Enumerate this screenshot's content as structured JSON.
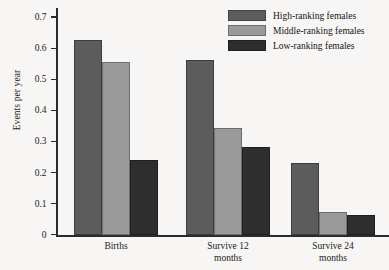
{
  "chart_data": {
    "type": "bar",
    "title": "",
    "xlabel": "",
    "ylabel": "Events per year",
    "categories": [
      "Births",
      "Survive 12 months",
      "Survive 24 months"
    ],
    "category_lines": [
      [
        "Births"
      ],
      [
        "Survive 12",
        "months"
      ],
      [
        "Survive 24",
        "months"
      ]
    ],
    "series": [
      {
        "name": "High-ranking females",
        "color": "#5c5c5c",
        "values": [
          0.63,
          0.563,
          0.234
        ]
      },
      {
        "name": "Middle-ranking females",
        "color": "#9a9a9a",
        "values": [
          0.559,
          0.344,
          0.075
        ]
      },
      {
        "name": "Low-ranking females",
        "color": "#2e2e2e",
        "values": [
          0.241,
          0.283,
          0.065
        ]
      }
    ],
    "ylim": [
      0,
      0.73
    ],
    "yticks": [
      0,
      0.1,
      0.2,
      0.3,
      0.4,
      0.5,
      0.6,
      0.7
    ],
    "ytick_labels": [
      "0",
      "0.1",
      "0.2",
      "0.3",
      "0.4",
      "0.5",
      "0.6",
      "0.7"
    ],
    "grid": false,
    "legend_position": "top-right"
  }
}
